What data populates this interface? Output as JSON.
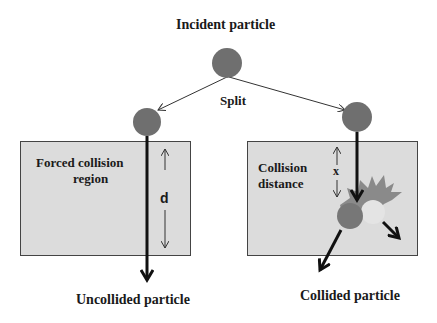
{
  "title": "Incident particle",
  "split_label": "Split",
  "left_panel": {
    "region_label_line1": "Forced collision",
    "region_label_line2": "region",
    "distance_label": "d",
    "exit_label": "Uncollided particle"
  },
  "right_panel": {
    "region_label_line1": "Collision",
    "region_label_line2": "distance",
    "distance_label": "x",
    "exit_label": "Collided particle"
  },
  "colors": {
    "particle": "#6f6f6f",
    "box_fill": "#dcdcdc",
    "box_stroke": "#444444",
    "splash": "#8a8a8a",
    "secondary_particle": "#e4e4e4"
  }
}
